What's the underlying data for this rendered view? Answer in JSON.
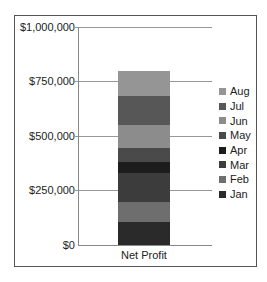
{
  "chart_data": {
    "type": "bar",
    "stacked": true,
    "title": "",
    "xlabel": "",
    "ylabel": "",
    "categories": [
      "Net Profit"
    ],
    "ylim": [
      0,
      1000000
    ],
    "yticks": [
      "$0",
      "$250,000",
      "$500,000",
      "$750,000",
      "$1,000,000"
    ],
    "grid": true,
    "legend_position": "right",
    "series": [
      {
        "name": "Jan",
        "values": [
          105000
        ],
        "color": "#2a2a2a"
      },
      {
        "name": "Feb",
        "values": [
          92000
        ],
        "color": "#6e6e6e"
      },
      {
        "name": "Mar",
        "values": [
          133000
        ],
        "color": "#3c3c3c"
      },
      {
        "name": "Apr",
        "values": [
          50000
        ],
        "color": "#1c1c1c"
      },
      {
        "name": "May",
        "values": [
          64000
        ],
        "color": "#4a4a4a"
      },
      {
        "name": "Jun",
        "values": [
          105000
        ],
        "color": "#8c8c8c"
      },
      {
        "name": "Jul",
        "values": [
          133000
        ],
        "color": "#575757"
      },
      {
        "name": "Aug",
        "values": [
          115000
        ],
        "color": "#959595"
      }
    ]
  },
  "axis": {
    "x_category_label": "Net Profit",
    "y_tick_labels": [
      "$1,000,000",
      "$750,000",
      "$500,000",
      "$250,000",
      "$0"
    ]
  },
  "legend": {
    "items": [
      "Aug",
      "Jul",
      "Jun",
      "May",
      "Apr",
      "Mar",
      "Feb",
      "Jan"
    ]
  }
}
